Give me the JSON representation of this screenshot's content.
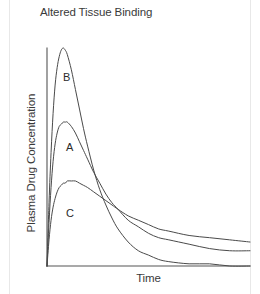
{
  "chart_data": {
    "type": "line",
    "title": "Altered Tissue Binding",
    "xlabel": "Time",
    "ylabel": "Plasma Drug Concentration",
    "grid": false,
    "legend_position": "inline-curve-labels",
    "xlim": [
      0,
      100
    ],
    "ylim": [
      0,
      100
    ],
    "axis_ticks": {
      "x": [],
      "y": []
    },
    "annotations": [
      {
        "text": "B",
        "x": 8,
        "y": 83
      },
      {
        "text": "A",
        "x": 10,
        "y": 49
      },
      {
        "text": "C",
        "x": 10,
        "y": 17
      }
    ],
    "series": [
      {
        "name": "B",
        "label": "B",
        "color": "#4a4a4a",
        "peak_time": 8,
        "peak_concentration": 100,
        "terminal_value": 1,
        "points": [
          [
            0,
            0
          ],
          [
            1,
            29
          ],
          [
            2,
            52
          ],
          [
            3,
            70
          ],
          [
            4,
            83
          ],
          [
            5,
            91
          ],
          [
            6,
            96
          ],
          [
            7,
            99
          ],
          [
            8,
            100
          ],
          [
            9,
            99
          ],
          [
            10,
            97
          ],
          [
            12,
            90
          ],
          [
            14,
            81
          ],
          [
            16,
            72
          ],
          [
            18,
            63
          ],
          [
            20,
            55
          ],
          [
            23,
            44
          ],
          [
            26,
            35
          ],
          [
            29,
            28
          ],
          [
            32,
            22
          ],
          [
            35,
            17
          ],
          [
            40,
            11
          ],
          [
            45,
            7
          ],
          [
            50,
            5
          ],
          [
            55,
            3
          ],
          [
            60,
            2
          ],
          [
            70,
            1
          ],
          [
            80,
            1
          ],
          [
            90,
            0
          ],
          [
            100,
            0
          ]
        ]
      },
      {
        "name": "A",
        "label": "A",
        "color": "#4a4a4a",
        "peak_time": 10,
        "peak_concentration": 66,
        "terminal_value": 7,
        "points": [
          [
            0,
            0
          ],
          [
            1,
            20
          ],
          [
            2,
            36
          ],
          [
            3,
            48
          ],
          [
            4,
            56
          ],
          [
            5,
            61
          ],
          [
            6,
            64
          ],
          [
            7,
            65
          ],
          [
            8,
            66
          ],
          [
            9,
            66
          ],
          [
            10,
            66
          ],
          [
            12,
            64
          ],
          [
            14,
            61
          ],
          [
            16,
            57
          ],
          [
            18,
            53
          ],
          [
            20,
            49
          ],
          [
            23,
            43
          ],
          [
            26,
            38
          ],
          [
            29,
            33
          ],
          [
            32,
            29
          ],
          [
            35,
            26
          ],
          [
            40,
            21
          ],
          [
            45,
            18
          ],
          [
            50,
            15
          ],
          [
            55,
            13
          ],
          [
            60,
            12
          ],
          [
            70,
            10
          ],
          [
            80,
            8
          ],
          [
            90,
            7
          ],
          [
            100,
            7
          ]
        ]
      },
      {
        "name": "C",
        "label": "C",
        "color": "#4a4a4a",
        "peak_time": 13,
        "peak_concentration": 39,
        "terminal_value": 11,
        "points": [
          [
            0,
            0
          ],
          [
            1,
            12
          ],
          [
            2,
            21
          ],
          [
            3,
            27
          ],
          [
            4,
            31
          ],
          [
            5,
            34
          ],
          [
            6,
            36
          ],
          [
            7,
            37
          ],
          [
            8,
            38
          ],
          [
            9,
            38
          ],
          [
            10,
            39
          ],
          [
            12,
            39
          ],
          [
            14,
            39
          ],
          [
            16,
            38
          ],
          [
            18,
            37
          ],
          [
            20,
            36
          ],
          [
            23,
            34
          ],
          [
            26,
            32
          ],
          [
            29,
            30
          ],
          [
            32,
            28
          ],
          [
            35,
            26
          ],
          [
            40,
            23
          ],
          [
            45,
            21
          ],
          [
            50,
            19
          ],
          [
            55,
            17
          ],
          [
            60,
            16
          ],
          [
            70,
            14
          ],
          [
            80,
            13
          ],
          [
            90,
            12
          ],
          [
            100,
            11
          ]
        ]
      }
    ]
  },
  "axes": {
    "origin_px": {
      "x": 47,
      "y": 266
    },
    "x_end_px": 250,
    "y_top_px": 48,
    "axis_color": "#555555"
  }
}
